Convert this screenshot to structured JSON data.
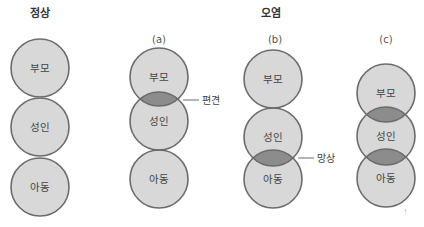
{
  "headings": {
    "normal": "정상",
    "pollution": "오염"
  },
  "panels": [
    {
      "id": "normal",
      "label": "",
      "circles": [
        "부모",
        "성인",
        "아동"
      ],
      "overlaps": []
    },
    {
      "id": "a",
      "label": "(a)",
      "circles": [
        "부모",
        "성인",
        "아동"
      ],
      "overlaps": [
        [
          0,
          1
        ]
      ]
    },
    {
      "id": "b",
      "label": "(b)",
      "circles": [
        "부모",
        "성인",
        "아동"
      ],
      "overlaps": [
        [
          1,
          2
        ]
      ]
    },
    {
      "id": "c",
      "label": "(c)",
      "circles": [
        "부모",
        "성인",
        "아동"
      ],
      "overlaps": [
        [
          0,
          1
        ],
        [
          1,
          2
        ]
      ]
    }
  ],
  "annotations": {
    "bias": "편견",
    "delusion": "망상"
  },
  "colors": {
    "circle_fill": "#d8d8d8",
    "circle_stroke": "#6b6b6b",
    "overlap_fill": "#8c8c8c",
    "text": "#444444"
  }
}
